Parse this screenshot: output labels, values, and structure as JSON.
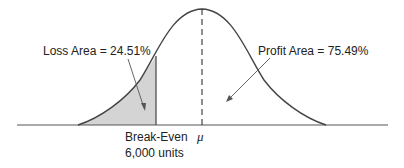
{
  "diagram": {
    "type": "normal-distribution-breakeven",
    "labels": {
      "loss": "Loss Area = 24.51%",
      "profit": "Profit Area = 75.49%",
      "breakeven_line1": "Break-Even",
      "breakeven_line2": "6,000 units",
      "mean": "μ"
    },
    "values": {
      "loss_area_pct": 24.51,
      "profit_area_pct": 75.49,
      "breakeven_units": 6000
    },
    "colors": {
      "curve": "#444444",
      "shade": "#d4d4d4",
      "axis": "#555555",
      "text": "#222222"
    }
  }
}
